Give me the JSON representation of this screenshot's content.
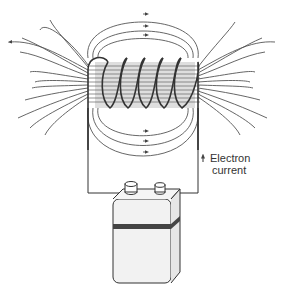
{
  "diagram": {
    "type": "solenoid-magnetic-field",
    "components": [
      "coil",
      "magnetic-field-lines",
      "battery",
      "wires"
    ],
    "label": {
      "line1": "Electron",
      "line2": "current"
    },
    "coil_turns": 6,
    "colors": {
      "line": "#444444",
      "coil": "#333333",
      "core_shade": "#bbbbbb",
      "battery_band": "#444444",
      "battery_body": "#f2f2f2"
    }
  }
}
